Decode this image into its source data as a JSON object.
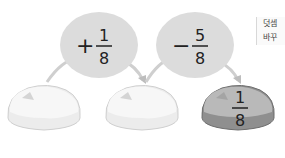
{
  "operations": [
    {
      "sign": "+",
      "numerator": "1",
      "denominator": "8"
    },
    {
      "sign": "−",
      "numerator": "5",
      "denominator": "8"
    }
  ],
  "stones": [
    {
      "label": "",
      "highlighted": false
    },
    {
      "label": "",
      "highlighted": false
    },
    {
      "label_numerator": "1",
      "label_denominator": "8",
      "highlighted": true
    }
  ],
  "side_note": {
    "line1": "덧셈",
    "line2": "바꾸"
  },
  "colors": {
    "bubble": "#dcdcdc",
    "stone_light": "#f4f4f4",
    "stone_dark": "#9a9a9a",
    "arrow": "#cfcfcf"
  }
}
